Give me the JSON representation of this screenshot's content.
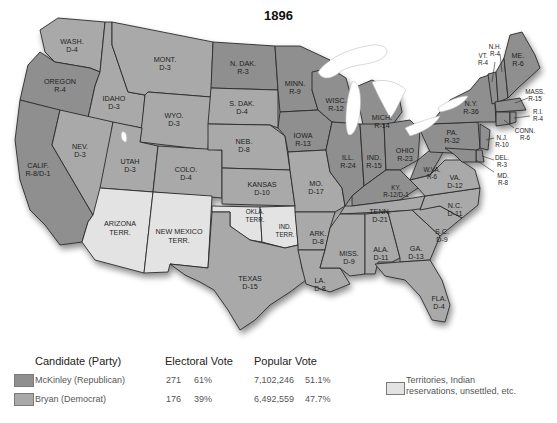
{
  "title": "1896",
  "colors": {
    "republican": "#8f8f8f",
    "democrat": "#a9a9a9",
    "territory": "#e3e3e3",
    "lake": "#ffffff",
    "border": "#2a2a2a"
  },
  "states": [
    {
      "id": "wash",
      "name": "WASH.",
      "result": "D-4",
      "party": "democrat"
    },
    {
      "id": "oregon",
      "name": "OREGON",
      "result": "R-4",
      "party": "republican"
    },
    {
      "id": "calif",
      "name": "CALIF.",
      "result": "R-8/D-1",
      "party": "republican"
    },
    {
      "id": "idaho",
      "name": "IDAHO",
      "result": "D-3",
      "party": "democrat"
    },
    {
      "id": "nev",
      "name": "NEV.",
      "result": "D-3",
      "party": "democrat"
    },
    {
      "id": "mont",
      "name": "MONT.",
      "result": "D-3",
      "party": "democrat"
    },
    {
      "id": "wyo",
      "name": "WYO.",
      "result": "D-3",
      "party": "democrat"
    },
    {
      "id": "utah",
      "name": "UTAH",
      "result": "D-3",
      "party": "democrat"
    },
    {
      "id": "colo",
      "name": "COLO.",
      "result": "D-4",
      "party": "democrat"
    },
    {
      "id": "ariz",
      "name": "ARIZONA",
      "result": "TERR.",
      "party": "territory"
    },
    {
      "id": "nm",
      "name": "NEW MEXICO",
      "result": "TERR.",
      "party": "territory"
    },
    {
      "id": "ndak",
      "name": "N. DAK.",
      "result": "R-3",
      "party": "republican"
    },
    {
      "id": "sdak",
      "name": "S. DAK.",
      "result": "D-4",
      "party": "democrat"
    },
    {
      "id": "neb",
      "name": "NEB.",
      "result": "D-8",
      "party": "democrat"
    },
    {
      "id": "kansas",
      "name": "KANSAS",
      "result": "D-10",
      "party": "democrat"
    },
    {
      "id": "okla",
      "name": "OKLA.",
      "result": "TERR.",
      "party": "territory"
    },
    {
      "id": "ind_terr",
      "name": "IND.",
      "result": "TERR.",
      "party": "territory"
    },
    {
      "id": "texas",
      "name": "TEXAS",
      "result": "D-15",
      "party": "democrat"
    },
    {
      "id": "minn",
      "name": "MINN.",
      "result": "R-9",
      "party": "republican"
    },
    {
      "id": "iowa",
      "name": "IOWA",
      "result": "R-13",
      "party": "republican"
    },
    {
      "id": "mo",
      "name": "MO.",
      "result": "D-17",
      "party": "democrat"
    },
    {
      "id": "ark",
      "name": "ARK.",
      "result": "D-8",
      "party": "democrat"
    },
    {
      "id": "la",
      "name": "LA.",
      "result": "D-8",
      "party": "democrat"
    },
    {
      "id": "wisc",
      "name": "WISC.",
      "result": "R-12",
      "party": "republican"
    },
    {
      "id": "ill",
      "name": "ILL.",
      "result": "R-24",
      "party": "republican"
    },
    {
      "id": "mich",
      "name": "MICH.",
      "result": "R-14",
      "party": "republican"
    },
    {
      "id": "ind",
      "name": "IND.",
      "result": "R-15",
      "party": "republican"
    },
    {
      "id": "ohio",
      "name": "OHIO",
      "result": "R-23",
      "party": "republican"
    },
    {
      "id": "ky",
      "name": "KY.",
      "result": "R-12/D-1",
      "party": "republican"
    },
    {
      "id": "tenn",
      "name": "TENN.",
      "result": "D-21",
      "party": "democrat"
    },
    {
      "id": "miss",
      "name": "MISS.",
      "result": "D-9",
      "party": "democrat"
    },
    {
      "id": "ala",
      "name": "ALA.",
      "result": "D-11",
      "party": "democrat"
    },
    {
      "id": "ga",
      "name": "GA.",
      "result": "D-13",
      "party": "democrat"
    },
    {
      "id": "fla",
      "name": "FLA.",
      "result": "D-4",
      "party": "democrat"
    },
    {
      "id": "sc",
      "name": "S.C.",
      "result": "D-9",
      "party": "democrat"
    },
    {
      "id": "nc",
      "name": "N.C.",
      "result": "D-11",
      "party": "democrat"
    },
    {
      "id": "va",
      "name": "VA.",
      "result": "D-12",
      "party": "democrat"
    },
    {
      "id": "wva",
      "name": "W.VA.",
      "result": "R-6",
      "party": "republican"
    },
    {
      "id": "pa",
      "name": "PA.",
      "result": "R-32",
      "party": "republican"
    },
    {
      "id": "ny",
      "name": "N.Y.",
      "result": "R-36",
      "party": "republican"
    },
    {
      "id": "vt",
      "name": "VT.",
      "result": "R-4",
      "party": "republican"
    },
    {
      "id": "nh",
      "name": "N.H.",
      "result": "R-4",
      "party": "republican"
    },
    {
      "id": "me",
      "name": "ME.",
      "result": "R-6",
      "party": "republican"
    },
    {
      "id": "mass",
      "name": "MASS.",
      "result": "R-15",
      "party": "republican"
    },
    {
      "id": "ri",
      "name": "R.I.",
      "result": "R-4",
      "party": "republican"
    },
    {
      "id": "conn",
      "name": "CONN.",
      "result": "R-6",
      "party": "republican"
    },
    {
      "id": "nj",
      "name": "N.J.",
      "result": "R-10",
      "party": "republican"
    },
    {
      "id": "del",
      "name": "DEL.",
      "result": "R-3",
      "party": "republican"
    },
    {
      "id": "md",
      "name": "MD.",
      "result": "R-8",
      "party": "republican"
    }
  ],
  "legend": {
    "headers": {
      "candidate": "Candidate (Party)",
      "electoral": "Electoral Vote",
      "popular": "Popular Vote"
    },
    "rows": [
      {
        "candidate": "McKinley (Republican)",
        "electoral_votes": "271",
        "electoral_pct": "61%",
        "popular_votes": "7,102,246",
        "popular_pct": "51.1%",
        "color": "#8f8f8f"
      },
      {
        "candidate": "Bryan (Democrat)",
        "electoral_votes": "176",
        "electoral_pct": "39%",
        "popular_votes": "6,492,559",
        "popular_pct": "47.7%",
        "color": "#a9a9a9"
      }
    ],
    "territory_note": {
      "line1": "Territories, Indian",
      "line2": "reservations, unsettled, etc.",
      "color": "#e3e3e3"
    }
  }
}
